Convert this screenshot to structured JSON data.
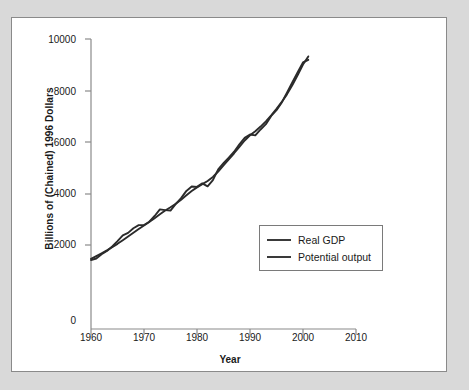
{
  "figure": {
    "background_color": "#d9d9d9",
    "panel_color": "#ffffff",
    "border_color": "#8a8a8a"
  },
  "chart_data": {
    "type": "line",
    "title": "",
    "subtitle": "",
    "xlabel": "Year",
    "ylabel": "Billions of (Chained) 1996 Dollars",
    "xlim": [
      1960,
      2010
    ],
    "ylim": [
      0,
      10000
    ],
    "xticks": [
      1960,
      1970,
      1980,
      1990,
      2000,
      2010
    ],
    "xtick_labels": [
      "1960",
      "1970",
      "1980",
      "1990",
      "2000",
      "2010"
    ],
    "yticks": [
      0,
      2000,
      4000,
      6000,
      8000,
      10000
    ],
    "ytick_labels": [
      "0",
      "2000",
      "4000",
      "6000",
      "8000",
      "10000"
    ],
    "grid": false,
    "legend_position": "center-right",
    "line_color": "#2b2b2b",
    "x": [
      1960,
      1961,
      1962,
      1963,
      1964,
      1965,
      1966,
      1967,
      1968,
      1969,
      1970,
      1971,
      1972,
      1973,
      1974,
      1975,
      1976,
      1977,
      1978,
      1979,
      1980,
      1981,
      1982,
      1983,
      1984,
      1985,
      1986,
      1987,
      1988,
      1989,
      1990,
      1991,
      1992,
      1993,
      1994,
      1995,
      1996,
      1997,
      1998,
      1999,
      2000,
      2001
    ],
    "series": [
      {
        "name": "Real GDP",
        "values": [
          2377,
          2432,
          2579,
          2691,
          2846,
          3029,
          3228,
          3316,
          3476,
          3582,
          3588,
          3700,
          3896,
          4123,
          4099,
          4085,
          4312,
          4511,
          4761,
          4912,
          4901,
          5022,
          4919,
          5132,
          5505,
          5717,
          5912,
          6113,
          6368,
          6592,
          6708,
          6676,
          6880,
          7063,
          7348,
          7544,
          7813,
          8160,
          8509,
          8859,
          9191,
          9281
        ]
      },
      {
        "name": "Potential output",
        "values": [
          2420,
          2516,
          2613,
          2713,
          2820,
          2937,
          3063,
          3190,
          3318,
          3447,
          3570,
          3692,
          3820,
          3955,
          4086,
          4200,
          4320,
          4460,
          4611,
          4760,
          4884,
          4994,
          5105,
          5245,
          5430,
          5640,
          5850,
          6060,
          6280,
          6500,
          6680,
          6820,
          6980,
          7160,
          7370,
          7590,
          7830,
          8100,
          8410,
          8760,
          9120,
          9400
        ]
      }
    ]
  },
  "legend": {
    "entries": [
      {
        "label": "Real GDP",
        "color": "#3a3a3a"
      },
      {
        "label": "Potential output",
        "color": "#3a3a3a"
      }
    ]
  }
}
